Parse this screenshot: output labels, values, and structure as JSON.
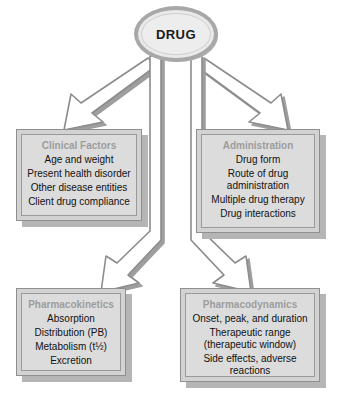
{
  "diagram": {
    "root": {
      "label": "DRUG",
      "shape": "ellipse"
    },
    "nodes": [
      {
        "id": "clinical-factors",
        "title": "Clinical Factors",
        "items": [
          "Age and weight",
          "Present health disorder",
          "Other disease entities",
          "Client drug compliance"
        ]
      },
      {
        "id": "administration",
        "title": "Administration",
        "items": [
          "Drug form",
          "Route of drug\nadministration",
          "Multiple drug therapy",
          "Drug interactions"
        ]
      },
      {
        "id": "pharmacokinetics",
        "title": "Pharmacokinetics",
        "items": [
          "Absorption",
          "Distribution (PB)",
          "Metabolism (t½)",
          "Excretion"
        ]
      },
      {
        "id": "pharmacodynamics",
        "title": "Pharmacodynamics",
        "items": [
          "Onset, peak, and duration",
          "Therapeutic range\n(therapeutic window)",
          "Side effects, adverse\nreactions"
        ]
      }
    ],
    "arrows": [
      {
        "id": "drug-to-clinical-factors",
        "from": "DRUG",
        "to": "Clinical Factors",
        "direction": "down-left"
      },
      {
        "id": "drug-to-administration",
        "from": "DRUG",
        "to": "Administration",
        "direction": "down-right"
      },
      {
        "id": "drug-to-pharmacokinetics",
        "from": "DRUG",
        "to": "Pharmacokinetics",
        "direction": "down-left"
      },
      {
        "id": "drug-to-pharmacodynamics",
        "from": "DRUG",
        "to": "Pharmacodynamics",
        "direction": "down-right"
      }
    ],
    "colors": {
      "background": "#ffffff",
      "box_fill": "#dcdcdc",
      "box_frame": "#d2d2d2",
      "box_border": "#8f8f8f",
      "shadow": "#b5b5b5",
      "title_text": "#9c9c9c",
      "body_text": "#111111",
      "oval_fill": "#ededed",
      "oval_border": "#a8a8a8",
      "arrow_fill": "#ffffff",
      "arrow_stroke": "#8c8c8c"
    }
  }
}
